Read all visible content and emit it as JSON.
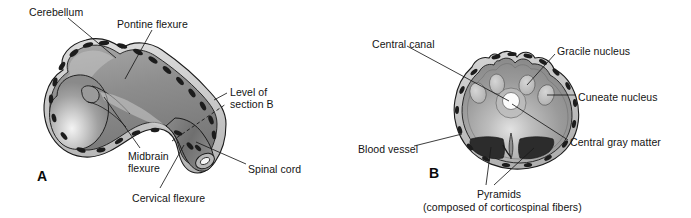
{
  "figure": {
    "background_color": "#ffffff",
    "text_color": "#141414",
    "width": 691,
    "height": 218
  },
  "panels": [
    {
      "id": "A",
      "id_label": "A",
      "name": "developing-brain-sagittal",
      "labels": [
        {
          "key": "cerebellum",
          "text": "Cerebellum",
          "x": 29,
          "y": 6
        },
        {
          "key": "pontine_flexure",
          "text": "Pontine flexure",
          "x": 117,
          "y": 18
        },
        {
          "key": "level_of",
          "text": "Level of",
          "x": 230,
          "y": 86
        },
        {
          "key": "section_b",
          "text": "section B",
          "x": 230,
          "y": 98
        },
        {
          "key": "midbrain",
          "text": "Midbrain",
          "x": 128,
          "y": 150
        },
        {
          "key": "flexure",
          "text": "flexure",
          "x": 128,
          "y": 162
        },
        {
          "key": "spinal_cord",
          "text": "Spinal cord",
          "x": 248,
          "y": 163
        },
        {
          "key": "cervical_flexure",
          "text": "Cervical flexure",
          "x": 132,
          "y": 192
        }
      ]
    },
    {
      "id": "B",
      "id_label": "B",
      "name": "medulla-cross-section",
      "labels": [
        {
          "key": "central_canal",
          "text": "Central canal",
          "x": 372,
          "y": 38
        },
        {
          "key": "gracile_nucleus",
          "text": "Gracile nucleus",
          "x": 557,
          "y": 45
        },
        {
          "key": "cuneate_nucleus",
          "text": "Cuneate nucleus",
          "x": 578,
          "y": 91
        },
        {
          "key": "central_gray_matter",
          "text": "Central gray matter",
          "x": 570,
          "y": 136
        },
        {
          "key": "blood_vessel",
          "text": "Blood vessel",
          "x": 358,
          "y": 143
        },
        {
          "key": "pyramids",
          "text": "Pyramids",
          "x": 477,
          "y": 188
        },
        {
          "key": "pyramids_note",
          "text": "(composed of corticospinal fibers)",
          "x": 423,
          "y": 201
        }
      ]
    }
  ],
  "colors": {
    "outline": "#1a1a1a",
    "leader_line": "#1a1a1a",
    "meninges_rim": "#c8c8c8",
    "brain_light": "#b4b4b4",
    "brain_mid": "#8e8e8e",
    "brain_dark": "#6e6e6e",
    "vessel_dark": "#1f1f1f",
    "nucleus_light": "#c2c2c2",
    "pyramid_dark": "#2e2e2e",
    "canal_white": "#fdfdfd"
  }
}
